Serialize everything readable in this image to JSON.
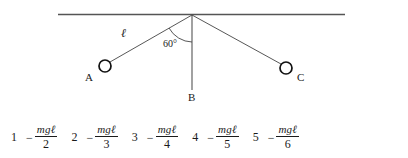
{
  "diagram": {
    "ceiling_label": "ceiling",
    "pivot_label": "pivot",
    "ball_a_label": "A",
    "ball_b_label": "B",
    "ball_c_label": "C",
    "string_length_label": "ℓ",
    "angle_label": "60°",
    "line_color": "#555555",
    "stroke_color": "#1a1a1a"
  },
  "answers": {
    "options": [
      {
        "index": "1",
        "sign": "−",
        "numerator": "mgℓ",
        "denominator": "2"
      },
      {
        "index": "2",
        "sign": "−",
        "numerator": "mgℓ",
        "denominator": "3"
      },
      {
        "index": "3",
        "sign": "−",
        "numerator": "mgℓ",
        "denominator": "4"
      },
      {
        "index": "4",
        "sign": "−",
        "numerator": "mgℓ",
        "denominator": "5"
      },
      {
        "index": "5",
        "sign": "−",
        "numerator": "mgℓ",
        "denominator": "6"
      }
    ]
  }
}
